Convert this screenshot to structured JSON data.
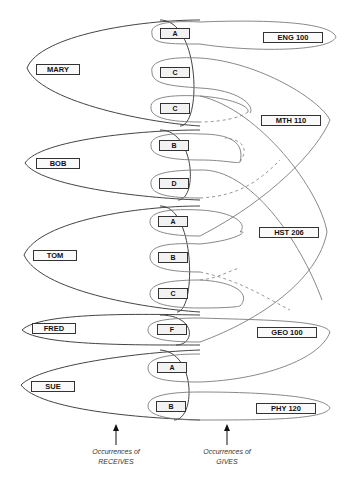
{
  "diagram": {
    "type": "entity-relationship occurrence diagram",
    "students": [
      {
        "name": "MARY",
        "x": 36,
        "y": 64
      },
      {
        "name": "BOB",
        "x": 36,
        "y": 158
      },
      {
        "name": "TOM",
        "x": 33,
        "y": 250
      },
      {
        "name": "FRED",
        "x": 32,
        "y": 323
      },
      {
        "name": "SUE",
        "x": 31,
        "y": 381
      }
    ],
    "grades": [
      {
        "label": "A",
        "x": 160,
        "y": 28
      },
      {
        "label": "C",
        "x": 160,
        "y": 67
      },
      {
        "label": "C",
        "x": 160,
        "y": 103
      },
      {
        "label": "B",
        "x": 159,
        "y": 140
      },
      {
        "label": "D",
        "x": 159,
        "y": 178
      },
      {
        "label": "A",
        "x": 158,
        "y": 216
      },
      {
        "label": "B",
        "x": 158,
        "y": 252
      },
      {
        "label": "C",
        "x": 158,
        "y": 288
      },
      {
        "label": "F",
        "x": 157,
        "y": 324
      },
      {
        "label": "A",
        "x": 157,
        "y": 362
      },
      {
        "label": "B",
        "x": 156,
        "y": 401
      }
    ],
    "courses": [
      {
        "name": "ENG 100",
        "x": 263,
        "y": 32
      },
      {
        "name": "MTH 110",
        "x": 261,
        "y": 115
      },
      {
        "name": "HST 206",
        "x": 259,
        "y": 227
      },
      {
        "name": "GEO 100",
        "x": 257,
        "y": 327
      },
      {
        "name": "PHY 120",
        "x": 256,
        "y": 403
      }
    ],
    "captions": {
      "receives": {
        "line1": "Occurrences of",
        "line2": "RECEIVES"
      },
      "gives": {
        "line1": "Occurrences of",
        "line2": "GIVES"
      }
    }
  }
}
